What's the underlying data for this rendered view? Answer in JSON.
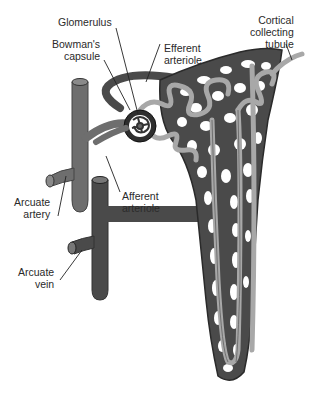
{
  "diagram": {
    "labels": {
      "glomerulus": "Glomerulus",
      "bowmans_capsule": "Bowman's\ncapsule",
      "efferent_arteriole": "Efferent\narteriole",
      "cortical_collecting_tubule": "Cortical\ncollecting\ntubule",
      "afferent_arteriole": "Afferent\narteriole",
      "arcuate_artery": "Arcuate\nartery",
      "arcuate_vein": "Arcuate\nvein"
    },
    "colors": {
      "vessel_dark": "#4a4a4a",
      "vessel_mid": "#6e6e6e",
      "tubule": "#a8a8a8",
      "outline": "#222222",
      "background": "#ffffff",
      "text": "#2a2a2a"
    }
  }
}
